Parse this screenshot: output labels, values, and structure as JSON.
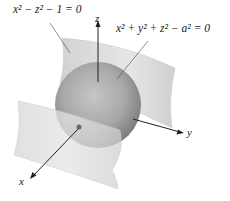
{
  "figure": {
    "surfaces": [
      {
        "name": "hyperbolic-cylinder",
        "equation": "x² − z² − 1 = 0"
      },
      {
        "name": "sphere",
        "equation": "x² + y² + z² − a² = 0"
      }
    ],
    "axes": {
      "x": "x",
      "y": "y",
      "z": "z"
    },
    "colors": {
      "sheet": "#d9d9d9",
      "sheet_edge": "#c4c4c4",
      "sphere_light": "#b5b5b5",
      "sphere_dark": "#7a7a7a",
      "axis": "#222222"
    }
  }
}
